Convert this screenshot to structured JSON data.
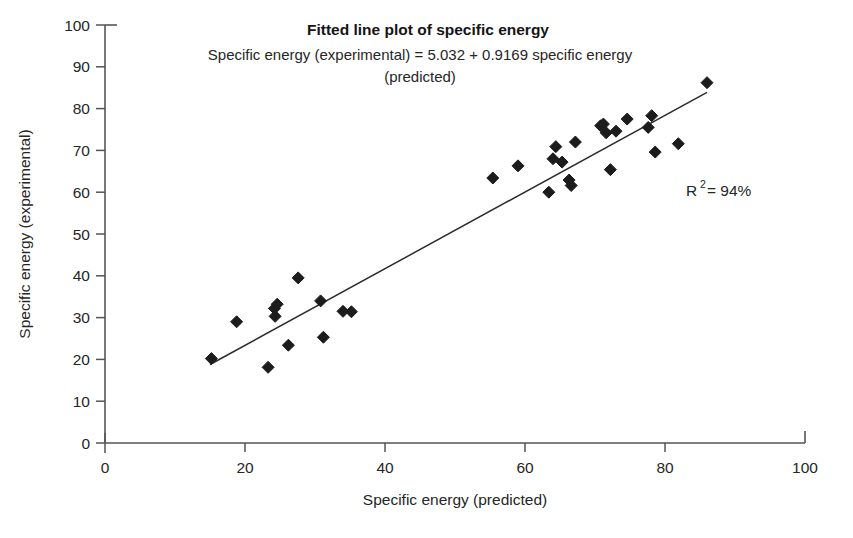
{
  "chart_data": {
    "type": "scatter",
    "title": "Fitted line plot of specific energy",
    "subtitle_line1": "Specific energy (experimental) = 5.032 + 0.9169 specific energy",
    "subtitle_line2": "(predicted)",
    "xlabel": "Specific energy (predicted)",
    "ylabel": "Specific energy (experimental)",
    "xlim": [
      0,
      100
    ],
    "ylim": [
      0,
      100
    ],
    "xticks": [
      0,
      20,
      40,
      60,
      80,
      100
    ],
    "yticks": [
      0,
      10,
      20,
      30,
      40,
      50,
      60,
      70,
      80,
      90,
      100
    ],
    "grid": false,
    "legend": "none",
    "annotations": [
      {
        "name": "r-squared",
        "text_prefix": "R",
        "text_sup": "2",
        "text_suffix": " = 94%",
        "value": 94,
        "unit": "%",
        "x": 88,
        "y": 62
      }
    ],
    "fit": {
      "intercept": 5.032,
      "slope": 0.9169,
      "x_start": 15,
      "x_end": 86,
      "equation": "Specific energy (experimental) = 5.032 + 0.9169 specific energy (predicted)"
    },
    "marker": {
      "shape": "diamond",
      "color": "#1c1c1c",
      "size": 9
    },
    "points": [
      [
        15.2,
        20.2
      ],
      [
        18.8,
        29.0
      ],
      [
        23.3,
        18.1
      ],
      [
        24.2,
        32.2
      ],
      [
        24.3,
        30.3
      ],
      [
        24.6,
        33.2
      ],
      [
        26.2,
        23.4
      ],
      [
        27.6,
        39.5
      ],
      [
        30.8,
        34.0
      ],
      [
        31.2,
        25.3
      ],
      [
        34.0,
        31.5
      ],
      [
        35.2,
        31.4
      ],
      [
        55.4,
        63.4
      ],
      [
        59.0,
        66.3
      ],
      [
        63.4,
        60.0
      ],
      [
        64.0,
        68.0
      ],
      [
        64.4,
        70.9
      ],
      [
        65.3,
        67.2
      ],
      [
        66.3,
        62.9
      ],
      [
        66.6,
        61.6
      ],
      [
        67.2,
        72.0
      ],
      [
        70.8,
        75.9
      ],
      [
        71.2,
        76.3
      ],
      [
        71.6,
        74.2
      ],
      [
        72.2,
        65.4
      ],
      [
        73.0,
        74.6
      ],
      [
        74.6,
        77.5
      ],
      [
        77.6,
        75.5
      ],
      [
        78.1,
        78.3
      ],
      [
        78.6,
        69.6
      ],
      [
        81.9,
        71.6
      ],
      [
        86.0,
        86.2
      ]
    ]
  },
  "layout": {
    "plot_left_px": 105,
    "plot_right_px": 805,
    "plot_top_px": 25,
    "plot_bottom_px": 443
  }
}
